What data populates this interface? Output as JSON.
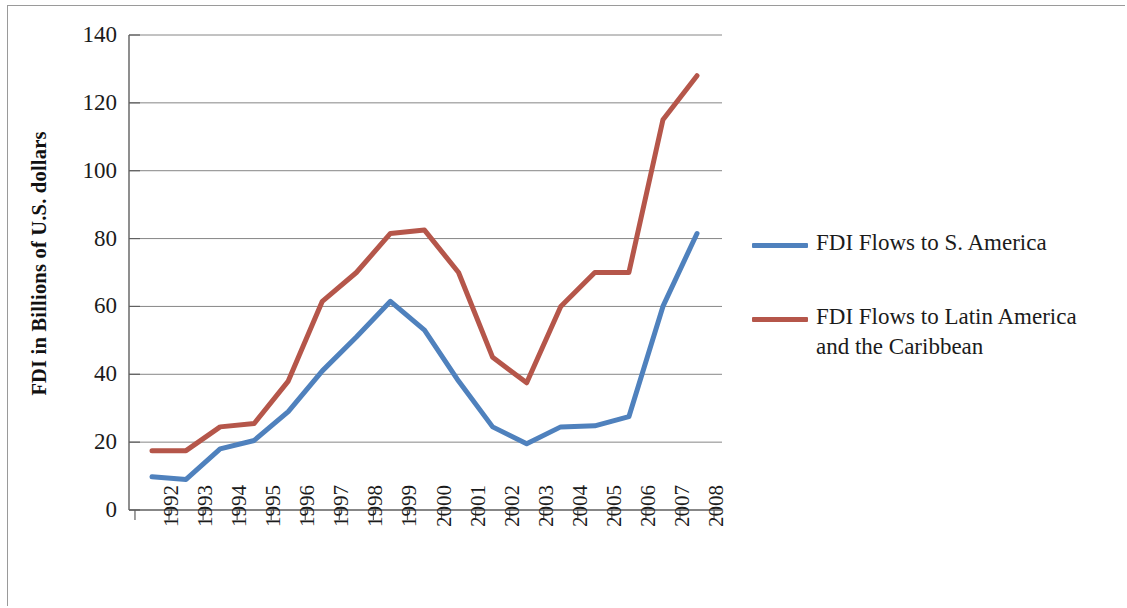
{
  "chart_data": {
    "type": "line",
    "title": "",
    "xlabel": "",
    "ylabel": "FDI in Billions of U.S. dollars",
    "categories": [
      "1992",
      "1993",
      "1994",
      "1995",
      "1996",
      "1997",
      "1998",
      "1999",
      "2000",
      "2001",
      "2002",
      "2003",
      "2004",
      "2005",
      "2006",
      "2007",
      "2008"
    ],
    "ylim": [
      0,
      140
    ],
    "yticks": [
      0,
      20,
      40,
      60,
      80,
      100,
      120,
      140
    ],
    "ytick_labels": [
      "0",
      "20",
      "40",
      "60",
      "80",
      "100",
      "120",
      "140"
    ],
    "grid": "horizontal",
    "legend_position": "right",
    "series": [
      {
        "name": "FDI Flows to S. America",
        "color": "#4F81BD",
        "values": [
          9.8,
          9.0,
          18.0,
          20.5,
          29.0,
          41.0,
          51.0,
          61.5,
          53.0,
          38.0,
          24.5,
          19.5,
          24.5,
          24.8,
          27.5,
          60.0,
          81.5
        ]
      },
      {
        "name": "FDI Flows to Latin America and the Caribbean",
        "color": "#B5564A",
        "values": [
          17.5,
          17.5,
          24.5,
          25.5,
          38.0,
          61.5,
          70.0,
          81.5,
          82.5,
          70.0,
          45.0,
          37.5,
          60.0,
          70.0,
          70.0,
          115.0,
          128.0
        ]
      }
    ]
  },
  "axis": {
    "y_title": "FDI in Billions of U.S. dollars"
  },
  "legend": {
    "items": [
      {
        "label": "FDI Flows to S. America",
        "color": "#4F81BD"
      },
      {
        "label": "FDI Flows to Latin America and the Caribbean",
        "color": "#B5564A"
      }
    ]
  },
  "colors": {
    "series_blue": "#4F81BD",
    "series_red": "#B5564A",
    "gridline": "#868686",
    "axis": "#5f5f5f",
    "frame": "#9a9a9a"
  }
}
